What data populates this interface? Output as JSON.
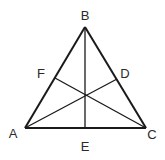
{
  "diagram": {
    "type": "triangle-with-cevians",
    "stroke_color": "#1a1a1a",
    "label_color": "#2a2a2a",
    "vertices": {
      "A": {
        "label": "A",
        "x": 25,
        "y": 128
      },
      "B": {
        "label": "B",
        "x": 85,
        "y": 27
      },
      "C": {
        "label": "C",
        "x": 146,
        "y": 128
      }
    },
    "side_points": {
      "D": {
        "label": "D",
        "x": 117,
        "y": 79
      },
      "E": {
        "label": "E",
        "x": 85,
        "y": 128
      },
      "F": {
        "label": "F",
        "x": 55,
        "y": 78
      }
    },
    "segments": [
      {
        "from": "A",
        "to": "B"
      },
      {
        "from": "B",
        "to": "C"
      },
      {
        "from": "A",
        "to": "C"
      },
      {
        "from": "B",
        "to": "E"
      },
      {
        "from": "A",
        "to": "D"
      },
      {
        "from": "C",
        "to": "F"
      }
    ],
    "labels": {
      "A": "A",
      "B": "B",
      "C": "C",
      "D": "D",
      "E": "E",
      "F": "F"
    }
  }
}
